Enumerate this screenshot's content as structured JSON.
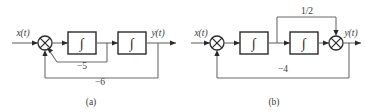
{
  "figure": {
    "type": "control-block-diagram",
    "count": 2,
    "line_color": "#6b6b6b",
    "block_color": "#2a2a2a",
    "background": "#ffffff"
  },
  "diagrams": [
    {
      "id": "a",
      "caption": "(a)",
      "input_label": "x(t)",
      "output_label": "y(t)",
      "blocks": [
        {
          "name": "integrator-1",
          "symbol": "∫"
        },
        {
          "name": "integrator-2",
          "symbol": "∫"
        }
      ],
      "summing_junctions": [
        {
          "name": "summer-1",
          "symbol": "⨁"
        }
      ],
      "feedback_paths": [
        {
          "name": "inner-feedback",
          "gain": "−5",
          "from": "between-integrators",
          "to": "summer-1"
        },
        {
          "name": "outer-feedback",
          "gain": "−6",
          "from": "output",
          "to": "summer-1"
        }
      ]
    },
    {
      "id": "b",
      "caption": "(b)",
      "input_label": "x(t)",
      "output_label": "y(t)",
      "blocks": [
        {
          "name": "integrator-1",
          "symbol": "∫"
        },
        {
          "name": "integrator-2",
          "symbol": "∫"
        }
      ],
      "summing_junctions": [
        {
          "name": "summer-1",
          "symbol": "⨁"
        },
        {
          "name": "summer-2",
          "symbol": "⨁"
        }
      ],
      "feedforward_paths": [
        {
          "name": "half-gain-path",
          "gain": "1/2",
          "from": "between-integrators",
          "to": "summer-2"
        }
      ],
      "feedback_paths": [
        {
          "name": "outer-feedback",
          "gain": "−4",
          "from": "output",
          "to": "summer-1"
        }
      ]
    }
  ]
}
